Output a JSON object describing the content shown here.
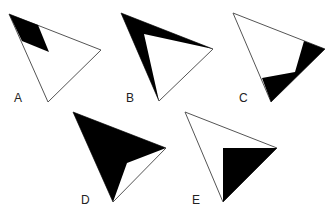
{
  "figure": {
    "colors": {
      "shade": "#000000",
      "outline": "#555555",
      "background": "#ffffff",
      "label": "#222222"
    },
    "options": [
      {
        "label": "A",
        "triangle": "9,14 101,50 48,102",
        "shade": "9,14 38,25 49,52 22,41",
        "label_pos": [
          14,
          102
        ]
      },
      {
        "label": "B",
        "triangle": "121,13 213,49 159,101",
        "shade": "121,13 213,49 144,34 159,101",
        "label_pos": [
          126,
          102
        ]
      },
      {
        "label": "C",
        "triangle": "233,13 325,49 271,102",
        "shade": "304,41 325,49 271,102 262,78 295,72",
        "label_pos": [
          239,
          102
        ]
      },
      {
        "label": "D",
        "triangle": "73,112 166,148 113,202",
        "shade": "73,112 166,148 127,163 113,202",
        "label_pos": [
          81,
          204
        ]
      },
      {
        "label": "E",
        "triangle": "185,112 277,148 223,202",
        "shade": "223,148 277,148 223,202",
        "label_pos": [
          192,
          204
        ]
      }
    ]
  }
}
